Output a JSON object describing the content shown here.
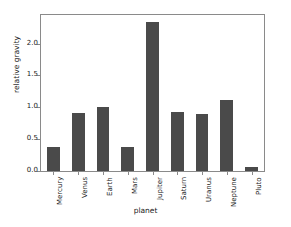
{
  "chart_data": {
    "type": "bar",
    "title": "",
    "xlabel": "planet",
    "ylabel": "relative gravity",
    "categories": [
      "Mercury",
      "Venus",
      "Earth",
      "Mars",
      "Jupiter",
      "Saturn",
      "Uranus",
      "Neptune",
      "Pluto"
    ],
    "values": [
      0.38,
      0.91,
      1.0,
      0.38,
      2.34,
      0.92,
      0.89,
      1.12,
      0.06
    ],
    "ylim": [
      0.0,
      2.45
    ],
    "yticks": [
      0.0,
      0.5,
      1.0,
      1.5,
      2.0
    ],
    "ytick_labels": [
      "0.0",
      "0.5",
      "1.0",
      "1.5",
      "2.0"
    ],
    "grid": false,
    "legend": false,
    "bar_color": "#4a4a4a",
    "axis_color": "#8a8a8a",
    "background": "#ffffff"
  }
}
